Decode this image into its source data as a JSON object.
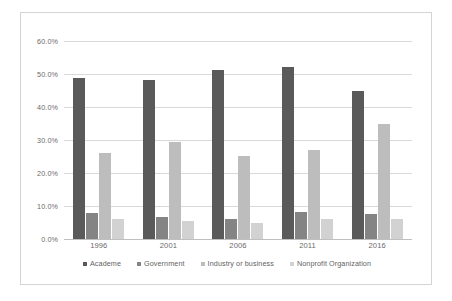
{
  "chart_data": {
    "type": "bar",
    "title": "",
    "subtitle": "",
    "xlabel": "",
    "ylabel": "",
    "categories": [
      "1996",
      "2001",
      "2006",
      "2011",
      "2016"
    ],
    "series": [
      {
        "name": "Academe",
        "color": "#5a5a5a",
        "values": [
          48.7,
          48.3,
          51.2,
          52.0,
          44.8
        ]
      },
      {
        "name": "Government",
        "color": "#848484",
        "values": [
          8.0,
          6.6,
          6.1,
          8.3,
          7.6
        ]
      },
      {
        "name": "Industry or business",
        "color": "#bdbdbd",
        "values": [
          26.0,
          29.3,
          25.1,
          27.1,
          34.8
        ]
      },
      {
        "name": "Nonprofit Organization",
        "color": "#d2d2d2",
        "values": [
          6.1,
          5.4,
          4.8,
          6.0,
          6.0
        ]
      }
    ],
    "ylim": [
      0,
      60
    ],
    "ytick_values": [
      0,
      10,
      20,
      30,
      40,
      50,
      60
    ],
    "ytick_labels": [
      "0.0%",
      "10.0%",
      "20.0%",
      "30.0%",
      "40.0%",
      "50.0%",
      "60.0%"
    ],
    "grid": true,
    "grid_axis": "y",
    "legend_position": "bottom",
    "value_unit": "percent"
  }
}
